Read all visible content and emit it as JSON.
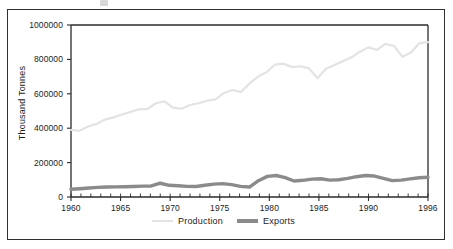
{
  "figure": {
    "frame_color": "#2f2f2f",
    "background": "#ffffff"
  },
  "chart_data": {
    "type": "line",
    "title": "",
    "subtitle": "",
    "xlabel": "",
    "ylabel": "Thousand Tonnes",
    "xlim": [
      1960,
      1996
    ],
    "ylim": [
      0,
      1000000
    ],
    "grid": false,
    "legend_position": "bottom",
    "x_tick_labels": [
      "1960",
      "1965",
      "1970",
      "1975",
      "1980",
      "1985",
      "1990",
      "1996"
    ],
    "x_tick_values": [
      1960,
      1965,
      1970,
      1975,
      1980,
      1985,
      1990,
      1996
    ],
    "x_minor_tick_step": 1,
    "y_tick_labels": [
      "0",
      "200000",
      "400000",
      "600000",
      "800000",
      "1000000"
    ],
    "y_tick_values": [
      0,
      200000,
      400000,
      600000,
      800000,
      1000000
    ],
    "x": [
      1960,
      1961,
      1962,
      1963,
      1964,
      1965,
      1966,
      1967,
      1968,
      1969,
      1970,
      1971,
      1972,
      1973,
      1974,
      1975,
      1976,
      1977,
      1978,
      1979,
      1980,
      1981,
      1982,
      1983,
      1984,
      1985,
      1986,
      1987,
      1988,
      1989,
      1990,
      1991,
      1992,
      1993,
      1994,
      1995,
      1996
    ],
    "series": [
      {
        "name": "Production",
        "color": "#e3e3e3",
        "line_width": 2.2,
        "values": [
          390000,
          385000,
          410000,
          425000,
          450000,
          463000,
          480000,
          495000,
          510000,
          512000,
          545000,
          556000,
          520000,
          513000,
          535000,
          545000,
          560000,
          568000,
          605000,
          622000,
          610000,
          660000,
          700000,
          725000,
          770000,
          775000,
          755000,
          760000,
          748000,
          690000,
          745000,
          768000,
          790000,
          812000,
          845000,
          870000,
          855000
        ]
      },
      {
        "name": "Exports",
        "color": "#8b8b8b",
        "line_width": 3.4,
        "values": [
          45000,
          48000,
          52000,
          56000,
          58000,
          59000,
          60000,
          61000,
          63000,
          64000,
          80000,
          68000,
          65000,
          62000,
          61000,
          68000,
          75000,
          78000,
          72000,
          62000,
          58000,
          95000,
          120000,
          125000,
          113000,
          93000,
          97000,
          104000,
          106000,
          98000,
          100000,
          108000,
          118000,
          125000,
          122000,
          108000,
          95000
        ]
      }
    ],
    "series_tail": {
      "Production": [
        890000,
        878000,
        815000,
        840000,
        895000,
        900000
      ],
      "Exports": [
        98000,
        105000,
        112000,
        115000
      ]
    }
  },
  "legend": {
    "items": [
      {
        "label": "Production",
        "color": "#e3e3e3"
      },
      {
        "label": "Exports",
        "color": "#8b8b8b"
      }
    ]
  }
}
